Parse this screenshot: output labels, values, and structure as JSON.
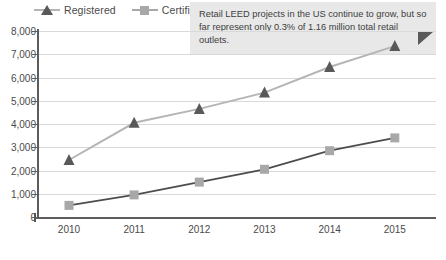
{
  "chart_data": {
    "type": "line",
    "title": "",
    "xlabel": "",
    "ylabel": "",
    "categories": [
      "2010",
      "2011",
      "2012",
      "2013",
      "2014",
      "2015"
    ],
    "ylim": [
      0,
      8000
    ],
    "ytick_step": 1000,
    "ytick_labels": [
      "0",
      "1,000",
      "2,000",
      "3,000",
      "4,000",
      "5,000",
      "6,000",
      "7,000",
      "8,000"
    ],
    "ytick_values": [
      0,
      1000,
      2000,
      3000,
      4000,
      5000,
      6000,
      7000,
      8000
    ],
    "grid": true,
    "legend_position": "top-left",
    "series": [
      {
        "name": "Registered",
        "marker": "triangle",
        "color": "#595959",
        "line_color": "#b5b5b5",
        "values": [
          2450,
          4050,
          4650,
          5350,
          6450,
          7350
        ]
      },
      {
        "name": "Certified",
        "marker": "square",
        "color": "#a8a8a8",
        "line_color": "#4d4d4d",
        "values": [
          500,
          950,
          1500,
          2050,
          2850,
          3400
        ]
      }
    ],
    "annotations": [
      {
        "name": "callout",
        "text": "Retail LEED projects in the US continue to grow, but so far represent only 0.3% of 1.16 million total retail outlets."
      }
    ]
  },
  "legend": {
    "items": [
      {
        "label": "Registered",
        "marker": "triangle-icon"
      },
      {
        "label": "Certified",
        "marker": "square-icon"
      }
    ]
  },
  "annotation": {
    "text": "Retail LEED projects in the US continue to grow, but so far represent only 0.3% of 1.16 million total retail outlets."
  },
  "caption": {
    "text": ""
  },
  "colors": {
    "registered_marker": "#595959",
    "registered_line": "#b5b5b5",
    "certified_marker": "#a8a8a8",
    "certified_line": "#4d4d4d",
    "grid": "#d9d9d9",
    "axis": "#5c5c5c",
    "annotation_bg": "#e8e8e8",
    "annotation_fold": "#5a5a5a",
    "text": "#4a4a4a"
  }
}
